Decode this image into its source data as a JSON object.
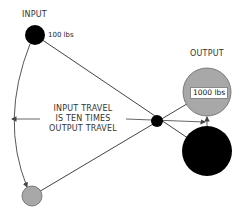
{
  "diagram": {
    "labels": {
      "input": "INPUT",
      "output": "OUTPUT",
      "input_weight": "100 lbs",
      "output_weight": "1000 lbs"
    },
    "caption": {
      "line1": "INPUT TRAVEL",
      "line2": "IS TEN TIMES",
      "line3": "OUTPUT TRAVEL"
    },
    "nodes": [
      {
        "id": "input-start",
        "cx": 35,
        "cy": 35,
        "r": 10,
        "fill": "#000000"
      },
      {
        "id": "input-end",
        "cx": 32,
        "cy": 196,
        "r": 10,
        "fill": "#a8a8a8"
      },
      {
        "id": "fulcrum",
        "cx": 157,
        "cy": 121,
        "r": 6,
        "fill": "#000000"
      },
      {
        "id": "output-start",
        "cx": 207,
        "cy": 92,
        "r": 24,
        "fill": "#a8a8a8"
      },
      {
        "id": "output-end",
        "cx": 207,
        "cy": 151,
        "r": 25,
        "fill": "#000000"
      }
    ],
    "colors": {
      "line": "#444444",
      "gray_circle": "#a8a8a8",
      "black_circle": "#000000",
      "text": "#333333"
    }
  }
}
